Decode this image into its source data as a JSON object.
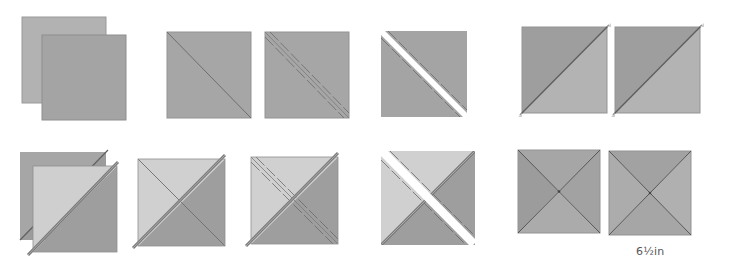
{
  "diagram": {
    "colors": {
      "fabric_dark": "#9c9c9c",
      "fabric_mid": "#a8a8a8",
      "fabric_light": "#cfcfcf",
      "fabric_back": "#b2b2b2",
      "seam": "#6e6e6e",
      "cut_gap": "#ffffff",
      "edge": "#8a8a8a"
    },
    "row1": [
      {
        "step": 1,
        "description": "Two squares layered right sides together"
      },
      {
        "step": 2,
        "description": "Draw diagonal line corner to corner"
      },
      {
        "step": 3,
        "description": "Stitch 1/4in each side of the drawn line"
      },
      {
        "step": 4,
        "description": "Cut on the drawn line"
      },
      {
        "step": 5,
        "description": "Press open to make two half-square triangle units"
      }
    ],
    "row2": [
      {
        "step": 6,
        "description": "Layer two half-square triangle units right sides together, seams nesting"
      },
      {
        "step": 7,
        "description": "Draw diagonal line across the seam"
      },
      {
        "step": 8,
        "description": "Stitch 1/4in each side of the drawn line"
      },
      {
        "step": 9,
        "description": "Cut on the drawn line"
      },
      {
        "step": 10,
        "description": "Press open to make two quarter-square triangle units"
      }
    ],
    "size_label": "6½in"
  }
}
